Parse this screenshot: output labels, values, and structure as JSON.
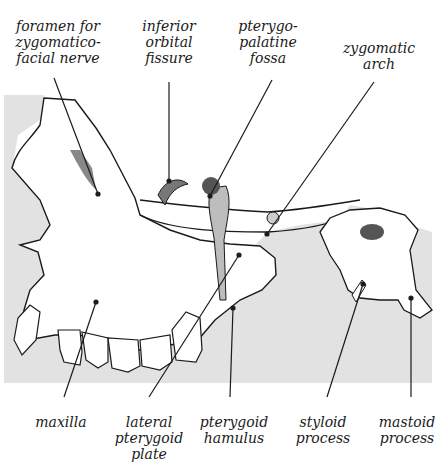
{
  "figure": {
    "background_color": "#ffffff",
    "panel_color": "#e2e2e2",
    "bone_color": "#ffffff",
    "outline_color": "#1a1a1a",
    "shadow_color": "#555555"
  },
  "labels": {
    "top": [
      {
        "id": "foramen",
        "text": "foramen for\nzygomatico-\nfacial nerve"
      },
      {
        "id": "inferior-orbital",
        "text": "inferior\norbital\nfissure"
      },
      {
        "id": "pterygopalatine",
        "text": "pterygo-\npalatine\nfossa"
      },
      {
        "id": "zygomatic-arch",
        "text": "zygomatic\narch"
      }
    ],
    "bottom": [
      {
        "id": "maxilla",
        "text": "maxilla"
      },
      {
        "id": "lateral-pterygoid",
        "text": "lateral\npterygoid\nplate"
      },
      {
        "id": "pterygoid-hamulus",
        "text": "pterygoid\nhamulus"
      },
      {
        "id": "styloid",
        "text": "styloid\nprocess"
      },
      {
        "id": "mastoid",
        "text": "mastoid\nprocess"
      }
    ]
  }
}
